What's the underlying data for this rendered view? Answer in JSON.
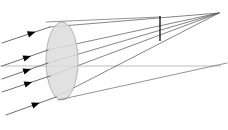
{
  "figure": {
    "title": "Converging lens ray diagram",
    "type": "optics-ray-trace",
    "width": 228,
    "height": 130,
    "background_color": "#ffffff"
  },
  "colors": {
    "ray_stroke": "#555555",
    "ray_stroke_light": "#6a6a6a",
    "axis_stroke": "#bcbcbc",
    "lens_fill": "#dcdcdc",
    "lens_stroke": "#b4b4b4",
    "marker_stroke": "#1a1a1a",
    "arrowhead_fill": "#000000"
  },
  "lens": {
    "label": "converging-lens",
    "center_x": 62,
    "center_y": 61,
    "radius_x": 16,
    "radius_y": 39,
    "fill": "#dcdcdc",
    "stroke": "#b4b4b4",
    "opacity": 0.85
  },
  "optical_axis": {
    "label": "optical-axis",
    "x1": 0,
    "y1": 66,
    "x2": 221,
    "y2": 66,
    "stroke": "#bcbcbc",
    "stroke_width": 1
  },
  "image_plane": {
    "label": "image-plane-marker",
    "x": 160,
    "y_top": 16,
    "y_bottom": 41,
    "stroke": "#1a1a1a",
    "stroke_width": 1.4
  },
  "focal_point": {
    "label": "focal-point",
    "x": 219,
    "y": 13
  },
  "incident_rays": [
    {
      "id": "incident-ray-1",
      "x1": 2,
      "y1": 43,
      "x2": 50,
      "y2": 27,
      "arrow_t": 0.62
    },
    {
      "id": "incident-ray-2",
      "x1": 2,
      "y1": 66,
      "x2": 48,
      "y2": 50,
      "arrow_t": 0.55
    },
    {
      "id": "incident-ray-3",
      "x1": 2,
      "y1": 79,
      "x2": 48,
      "y2": 63,
      "arrow_t": 0.55
    },
    {
      "id": "incident-ray-4",
      "x1": 2,
      "y1": 92,
      "x2": 50,
      "y2": 76,
      "arrow_t": 0.55
    },
    {
      "id": "incident-ray-5",
      "x1": 6,
      "y1": 115,
      "x2": 56,
      "y2": 97,
      "arrow_t": 0.6
    }
  ],
  "refracted_rays": [
    {
      "id": "refracted-ray-1",
      "x1": 50,
      "y1": 27,
      "x2": 219,
      "y2": 13
    },
    {
      "id": "refracted-ray-2",
      "x1": 48,
      "y1": 50,
      "x2": 219,
      "y2": 13
    },
    {
      "id": "refracted-ray-3",
      "x1": 48,
      "y1": 63,
      "x2": 219,
      "y2": 13
    },
    {
      "id": "refracted-ray-4",
      "x1": 50,
      "y1": 76,
      "x2": 219,
      "y2": 13
    },
    {
      "id": "refracted-ray-5",
      "x1": 56,
      "y1": 97,
      "x2": 219,
      "y2": 13
    }
  ],
  "through_rays": [
    {
      "id": "chief-ray-upper",
      "x1": 46,
      "y1": 22,
      "x2": 160,
      "y2": 17
    },
    {
      "id": "chief-ray-lower",
      "x1": 58,
      "y1": 100,
      "x2": 227,
      "y2": 63
    }
  ],
  "arrowhead": {
    "label": "direction-arrowhead",
    "length": 8,
    "half_width": 3.2,
    "fill": "#000000"
  }
}
